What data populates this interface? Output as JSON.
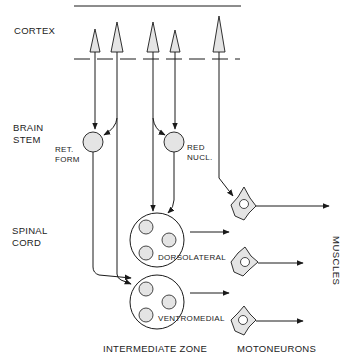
{
  "diagram": {
    "levels": {
      "cortex": "CORTEX",
      "brain_stem_line1": "BRAIN",
      "brain_stem_line2": "STEM",
      "spinal_cord_line1": "SPINAL",
      "spinal_cord_line2": "CORD"
    },
    "nuclei": {
      "ret_form_line1": "RET.",
      "ret_form_line2": "FORM",
      "red_nucl_line1": "RED",
      "red_nucl_line2": "NUCL."
    },
    "zones": {
      "dorsolateral": "DORSOLATERAL",
      "ventromedial": "VENTROMEDIAL"
    },
    "bottom_labels": {
      "intermediate_zone": "INTERMEDIATE ZONE",
      "motoneurons": "MOTONEURONS"
    },
    "target": "MUSCLES",
    "colors": {
      "line": "#1a1a1a",
      "fill": "#e4e4e4"
    }
  }
}
